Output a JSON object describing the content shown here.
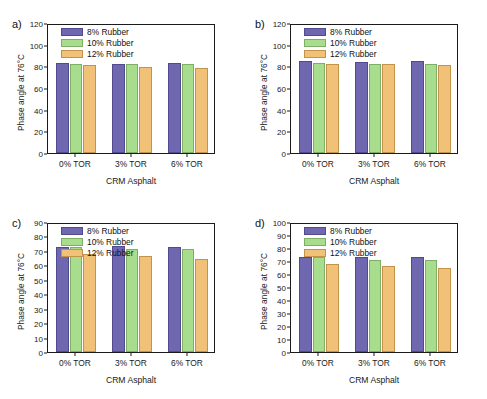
{
  "figure": {
    "panels": [
      {
        "label": "a)",
        "xlabel": "CRM Asphalt",
        "ylabel": "Phase angle at 76°C",
        "ylim": [
          0,
          120
        ],
        "ytick_step": 20,
        "yticks": [
          "0",
          "20",
          "40",
          "60",
          "80",
          "100",
          "120"
        ],
        "categories": [
          "0% TOR",
          "3% TOR",
          "6% TOR"
        ],
        "legend": [
          "8%  Rubber",
          "10% Rubber",
          "12% Rubber"
        ],
        "series": [
          {
            "name": "8%  Rubber",
            "values": [
              83.5,
              82.5,
              83.0
            ]
          },
          {
            "name": "10% Rubber",
            "values": [
              82.0,
              82.0,
              82.0
            ]
          },
          {
            "name": "12% Rubber",
            "values": [
              81.2,
              79.5,
              78.5
            ]
          }
        ]
      },
      {
        "label": "b)",
        "xlabel": "CRM Asphalt",
        "ylabel": "Phase angle at 76°C",
        "ylim": [
          0,
          120
        ],
        "ytick_step": 20,
        "yticks": [
          "0",
          "20",
          "40",
          "60",
          "80",
          "100",
          "120"
        ],
        "categories": [
          "0% TOR",
          "3% TOR",
          "6% TOR"
        ],
        "legend": [
          "8%  Rubber",
          "10% Rubber",
          "12% Rubber"
        ],
        "series": [
          {
            "name": "8%  Rubber",
            "values": [
              84.5,
              84.0,
              85.0
            ]
          },
          {
            "name": "10% Rubber",
            "values": [
              83.0,
              82.0,
              82.5
            ]
          },
          {
            "name": "12% Rubber",
            "values": [
              82.0,
              82.0,
              81.0
            ]
          }
        ]
      },
      {
        "label": "c)",
        "xlabel": "CRM Asphalt",
        "ylabel": "Phase angle at 76°C",
        "ylim": [
          0,
          90
        ],
        "ytick_step": 10,
        "yticks": [
          "0",
          "10",
          "20",
          "30",
          "40",
          "50",
          "60",
          "70",
          "80",
          "90"
        ],
        "categories": [
          "0% TOR",
          "3% TOR",
          "6% TOR"
        ],
        "legend": [
          "8%  Rubber",
          "10% Rubber",
          "12% Rubber"
        ],
        "series": [
          {
            "name": "8%  Rubber",
            "values": [
              73.0,
              73.6,
              73.0
            ]
          },
          {
            "name": "10% Rubber",
            "values": [
              73.0,
              71.2,
              71.0
            ]
          },
          {
            "name": "12% Rubber",
            "values": [
              68.2,
              66.2,
              64.7
            ]
          }
        ]
      },
      {
        "label": "d)",
        "xlabel": "CRM Asphalt",
        "ylabel": "Phase angle at 76°C",
        "ylim": [
          0,
          100
        ],
        "ytick_step": 10,
        "yticks": [
          "0",
          "10",
          "20",
          "30",
          "40",
          "50",
          "60",
          "70",
          "80",
          "90",
          "100"
        ],
        "categories": [
          "0% TOR",
          "3% TOR",
          "6% TOR"
        ],
        "legend": [
          "8%  Rubber",
          "10% Rubber",
          "12% Rubber"
        ],
        "series": [
          {
            "name": "8%  Rubber",
            "values": [
              73.0,
              72.8,
              73.2
            ]
          },
          {
            "name": "10% Rubber",
            "values": [
              72.8,
              71.0,
              70.5
            ]
          },
          {
            "name": "12% Rubber",
            "values": [
              68.0,
              66.0,
              64.5
            ]
          }
        ]
      }
    ]
  },
  "chart_data": {
    "type": "bar",
    "title": "",
    "panel_count": 4,
    "shared": {
      "categories": [
        "0% TOR",
        "3% TOR",
        "6% TOR"
      ],
      "series_names": [
        "8%  Rubber",
        "10% Rubber",
        "12% Rubber"
      ],
      "colors": [
        "#6f68b0",
        "#a9dd8e",
        "#f0c176"
      ],
      "xlabel": "CRM Asphalt",
      "ylabel": "Phase angle at 76°C",
      "grid": false,
      "legend_position": "top-left"
    },
    "panels": [
      {
        "panel": "a)",
        "ylim": [
          0,
          120
        ],
        "ytick_step": 20,
        "categories": [
          "0% TOR",
          "3% TOR",
          "6% TOR"
        ],
        "series": [
          {
            "name": "8%  Rubber",
            "values": [
              83.5,
              82.5,
              83.0
            ]
          },
          {
            "name": "10% Rubber",
            "values": [
              82.0,
              82.0,
              82.0
            ]
          },
          {
            "name": "12% Rubber",
            "values": [
              81.2,
              79.5,
              78.5
            ]
          }
        ]
      },
      {
        "panel": "b)",
        "ylim": [
          0,
          120
        ],
        "ytick_step": 20,
        "categories": [
          "0% TOR",
          "3% TOR",
          "6% TOR"
        ],
        "series": [
          {
            "name": "8%  Rubber",
            "values": [
              84.5,
              84.0,
              85.0
            ]
          },
          {
            "name": "10% Rubber",
            "values": [
              83.0,
              82.0,
              82.5
            ]
          },
          {
            "name": "12% Rubber",
            "values": [
              82.0,
              82.0,
              81.0
            ]
          }
        ]
      },
      {
        "panel": "c)",
        "ylim": [
          0,
          90
        ],
        "ytick_step": 10,
        "categories": [
          "0% TOR",
          "3% TOR",
          "6% TOR"
        ],
        "series": [
          {
            "name": "8%  Rubber",
            "values": [
              73.0,
              73.6,
              73.0
            ]
          },
          {
            "name": "10% Rubber",
            "values": [
              73.0,
              71.2,
              71.0
            ]
          },
          {
            "name": "12% Rubber",
            "values": [
              68.2,
              66.2,
              64.7
            ]
          }
        ]
      },
      {
        "panel": "d)",
        "ylim": [
          0,
          100
        ],
        "ytick_step": 10,
        "categories": [
          "0% TOR",
          "3% TOR",
          "6% TOR"
        ],
        "series": [
          {
            "name": "8%  Rubber",
            "values": [
              73.0,
              72.8,
              73.2
            ]
          },
          {
            "name": "10% Rubber",
            "values": [
              72.8,
              71.0,
              70.5
            ]
          },
          {
            "name": "12% Rubber",
            "values": [
              68.0,
              66.0,
              64.5
            ]
          }
        ]
      }
    ]
  }
}
